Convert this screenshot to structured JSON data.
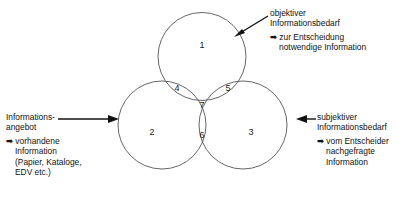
{
  "diagram": {
    "type": "venn-3-circle",
    "title_visible": false,
    "background_color": "#ffffff",
    "stroke_color": "#555555",
    "text_color": "#111111",
    "regions": [
      {
        "id": "r1",
        "label": "1",
        "meaning": "objektiver Informationsbedarf only"
      },
      {
        "id": "r2",
        "label": "2",
        "meaning": "Informationsangebot only"
      },
      {
        "id": "r3",
        "label": "3",
        "meaning": "subjektiver Informationsbedarf only"
      },
      {
        "id": "r4",
        "label": "4",
        "meaning": "objektiver Bedarf + Angebot"
      },
      {
        "id": "r5",
        "label": "5",
        "meaning": "objektiver Bedarf + subjektiver Bedarf"
      },
      {
        "id": "r6",
        "label": "6",
        "meaning": "Angebot + subjektiver Bedarf"
      },
      {
        "id": "r7",
        "label": "7",
        "meaning": "alle drei"
      }
    ]
  },
  "annotations": {
    "top_right": {
      "heading_line1": "objektiver",
      "heading_line2": "Informationsbedarf",
      "bullet_glyph": "➡",
      "bullet_line1": "zur Entscheidung",
      "bullet_line2": "notwendige Information",
      "arrow_direction": "down-left"
    },
    "left": {
      "heading_line1": "Informations-",
      "heading_line2": "angebot",
      "bullet_glyph": "➡",
      "bullet_line1": "vorhandene",
      "bullet_line2": "Information",
      "bullet_line3": "(Papier, Kataloge,",
      "bullet_line4": "EDV etc.)",
      "arrow_direction": "right"
    },
    "right": {
      "heading_line1": "subjektiver",
      "heading_line2": "Informationsbedarf",
      "bullet_glyph": "➡",
      "bullet_line1": "vom Entscheider",
      "bullet_line2": "nachgefragte",
      "bullet_line3": "Information",
      "arrow_direction": "left"
    }
  }
}
